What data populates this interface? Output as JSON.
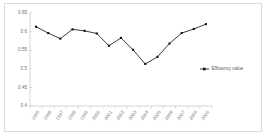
{
  "chart_data": {
    "type": "line",
    "title": "",
    "xlabel": "",
    "ylabel": "",
    "categories": [
      "1995",
      "1996",
      "1997",
      "1998",
      "1999",
      "2000",
      "2001",
      "2002",
      "2003",
      "2004",
      "2005",
      "2006",
      "2007",
      "2008",
      "2009"
    ],
    "series": [
      {
        "name": "Efficiency value",
        "values": [
          0.613,
          0.596,
          0.581,
          0.606,
          0.602,
          0.595,
          0.562,
          0.583,
          0.551,
          0.513,
          0.532,
          0.568,
          0.596,
          0.607,
          0.62
        ]
      }
    ],
    "ylim": [
      0.4,
      0.65
    ],
    "yticks": [
      0.4,
      0.45,
      0.5,
      0.55,
      0.6,
      0.65
    ],
    "ytick_labels": [
      "0.4",
      "0.45",
      "0.5",
      "0.55",
      "0.6",
      "0.65"
    ],
    "grid": false,
    "legend_position": "right",
    "marker": "square",
    "line_color": "#1a1a1a",
    "axis_color": "#b9b9b9",
    "tick_label_color": "#6e6e6e",
    "background_color": "#ffffff",
    "border_color": "#dcdcdc"
  },
  "legend": {
    "entries": [
      {
        "label": "Efficiency value",
        "marker": "square-with-line",
        "color": "#1a1a1a"
      }
    ]
  }
}
